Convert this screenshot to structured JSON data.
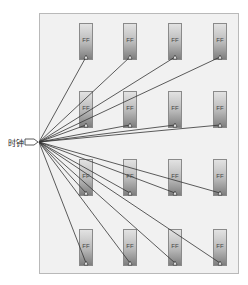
{
  "diagram": {
    "type": "clock-distribution-fanout",
    "clock_source": {
      "label": "时钟",
      "x": 39,
      "y": 142
    },
    "flip_flop_label": "FF",
    "rows": 4,
    "columns": 4,
    "column_x": [
      79,
      123,
      168,
      213
    ],
    "row_y": [
      23,
      91,
      159,
      229
    ],
    "ff_width": 14,
    "ff_height": 37,
    "colors": {
      "wire": "#333333",
      "frame_bg": "#f1f1f1",
      "frame_border": "#b9b9b9"
    }
  }
}
